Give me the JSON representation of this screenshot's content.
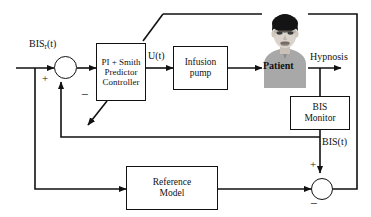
{
  "diagram": {
    "type": "control-block-diagram",
    "background_color": "#ffffff",
    "line_color": "#111111"
  },
  "signals": {
    "reference_input": "BIS",
    "reference_input_subscript": "r",
    "reference_input_suffix": "(t)",
    "control_signal": "U(t)",
    "plant_output": "Hypnosis",
    "measured_output": "BIS(t)"
  },
  "blocks": [
    {
      "id": "controller",
      "line1": "PI + Smith",
      "line2": "Predictor",
      "line3": "Controller"
    },
    {
      "id": "pump",
      "line1": "Infusion",
      "line2": "pump"
    },
    {
      "id": "patient",
      "label": "Patient"
    },
    {
      "id": "monitor",
      "line1": "BIS",
      "line2": "Monitor"
    },
    {
      "id": "reference_model",
      "line1": "Reference",
      "line2": "Model"
    }
  ],
  "summing_junctions": [
    {
      "id": "error-junction",
      "signs": {
        "left": "+",
        "bottom": "−"
      }
    },
    {
      "id": "model-error-junction",
      "signs": {
        "top": "+",
        "bottom_left": "−"
      }
    }
  ],
  "signs": {
    "plus": "+",
    "minus": "−"
  },
  "colors": {
    "stroke": "#111111",
    "patient_shirt": "#a9a9a9",
    "patient_cap": "#161616",
    "patient_skin": "#d8d2ca",
    "patient_bg": "#cfcfcf"
  }
}
